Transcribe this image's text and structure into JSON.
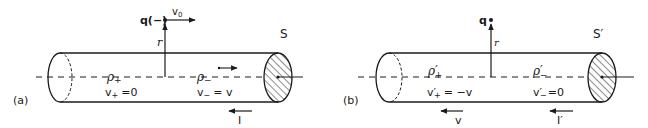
{
  "panel_a": {
    "tag": "(a)",
    "frame": "S",
    "charge": "q(−)",
    "charge_velocity": "v",
    "charge_velocity_sub": "0",
    "radius": "r",
    "rho_plus": "ρ",
    "rho_plus_sub": "+",
    "v_plus": "v",
    "v_plus_sub": "+",
    "v_plus_val": "=0",
    "rho_minus": "ρ",
    "rho_minus_sub": "−",
    "v_minus": "v",
    "v_minus_sub": "−",
    "v_minus_val": "= v",
    "current": "I"
  },
  "panel_b": {
    "tag": "(b)",
    "frame": "S′",
    "charge": "q",
    "radius": "r",
    "rho_plus": "ρ′",
    "rho_plus_sub": "+",
    "v_plus": "v′",
    "v_plus_sub": "+",
    "v_plus_val": "= −v",
    "rho_minus": "ρ′",
    "rho_minus_sub": "−",
    "v_minus": "v′",
    "v_minus_sub": "−",
    "v_minus_val": "=0",
    "velocity_label": "v",
    "current": "I′"
  }
}
